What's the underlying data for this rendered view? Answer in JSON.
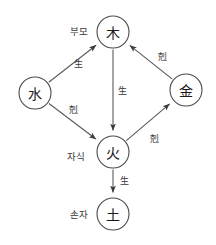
{
  "diagram": {
    "colors": {
      "background": "#ffffff",
      "stroke": "#5a5a5a",
      "node_stroke": "#4a4a4a",
      "text": "#1a1a1a"
    },
    "nodes": [
      {
        "id": "wood",
        "glyph": "木",
        "cx": 113,
        "cy": 32,
        "r": 16
      },
      {
        "id": "water",
        "glyph": "水",
        "cx": 35,
        "cy": 93,
        "r": 16
      },
      {
        "id": "metal",
        "glyph": "金",
        "cx": 186,
        "cy": 90,
        "r": 16
      },
      {
        "id": "fire",
        "glyph": "火",
        "cx": 113,
        "cy": 152,
        "r": 16
      },
      {
        "id": "earth",
        "glyph": "土",
        "cx": 113,
        "cy": 214,
        "r": 16
      }
    ],
    "edges": [
      {
        "id": "water-to-wood",
        "from": "water",
        "to": "wood",
        "label": "生",
        "label_x": 78,
        "label_y": 64
      },
      {
        "id": "water-to-fire",
        "from": "water",
        "to": "fire",
        "label": "剋",
        "label_x": 73,
        "label_y": 110
      },
      {
        "id": "wood-to-fire",
        "from": "wood",
        "to": "fire",
        "label": "生",
        "label_x": 122,
        "label_y": 91
      },
      {
        "id": "fire-to-earth",
        "from": "fire",
        "to": "earth",
        "label": "生",
        "label_x": 124,
        "label_y": 181
      },
      {
        "id": "fire-to-metal",
        "from": "fire",
        "to": "metal",
        "label": "剋",
        "label_x": 154,
        "label_y": 139
      },
      {
        "id": "metal-to-wood",
        "from": "metal",
        "to": "wood",
        "label": "剋",
        "label_x": 162,
        "label_y": 57
      }
    ],
    "kinship_labels": [
      {
        "id": "parent",
        "text": "부모",
        "x": 79,
        "y": 31
      },
      {
        "id": "child",
        "text": "자식",
        "x": 76,
        "y": 156
      },
      {
        "id": "grandchild",
        "text": "손자",
        "x": 79,
        "y": 214
      }
    ]
  }
}
